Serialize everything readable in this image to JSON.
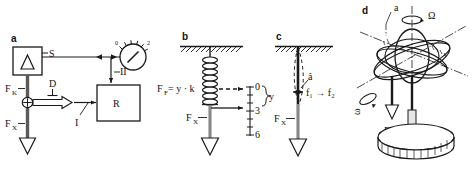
{
  "figure": {
    "background": "#ffffff",
    "ink": "#1a1a1a",
    "panels": [
      {
        "id": "a",
        "label": "a",
        "name": "panel-a-block-diagram",
        "elements": {
          "sensor_box_label": "S",
          "resistor_box_label": "R",
          "force_upper": "F",
          "force_upper_sub": "K",
          "force_lower": "F",
          "force_lower_sub": "X",
          "damper_label": "D",
          "signal_one": "I",
          "signal_two": "II",
          "gauge_ticks": [
            "0",
            "2"
          ]
        }
      },
      {
        "id": "b",
        "label": "b",
        "name": "panel-b-spring",
        "elements": {
          "formula": "F",
          "formula_sub": "F",
          "formula_rest": "= y · k",
          "force_label": "F",
          "force_sub": "X",
          "brace_label": "y",
          "scale_values": [
            "0",
            "3",
            "6"
          ]
        }
      },
      {
        "id": "c",
        "label": "c",
        "name": "panel-c-vibrating-rod",
        "elements": {
          "amplitude": "â",
          "frequency": "f₁ → f₂",
          "force_label": "F",
          "force_sub": "X"
        }
      },
      {
        "id": "d",
        "label": "d",
        "name": "panel-d-gyroscope",
        "elements": {
          "accel_label": "a",
          "omega_big": "Ω",
          "omega_small": "ω",
          "force_label": "F",
          "force_sub": "X"
        }
      }
    ]
  }
}
